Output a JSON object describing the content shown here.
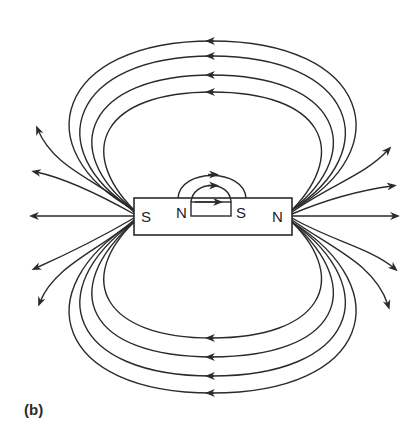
{
  "figure": {
    "caption": "(b)",
    "stroke_color": "#2a2a2a",
    "background": "#ffffff"
  },
  "magnet": {
    "outer": {
      "left_pole": "S",
      "right_pole": "N"
    },
    "inner": {
      "left_pole": "N",
      "right_pole": "S"
    }
  },
  "field_lines": {
    "top_loops": 4,
    "bottom_loops": 4,
    "open_lines_left": 5,
    "open_lines_right": 5,
    "inner_loops": 3,
    "loop_arrow_direction": "left",
    "inner_arrow_direction": "right"
  }
}
